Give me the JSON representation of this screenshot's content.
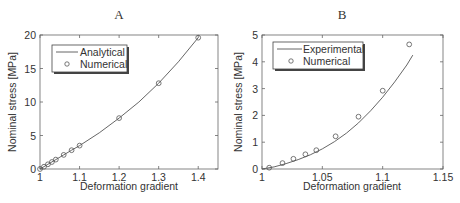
{
  "chart_data": [
    {
      "id": "A",
      "type": "line",
      "title": "A",
      "xlabel": "Deformation gradient",
      "ylabel": "Nominal stress [MPa]",
      "xlim": [
        1.0,
        1.45
      ],
      "ylim": [
        0,
        20
      ],
      "xticks": [
        1,
        1.1,
        1.2,
        1.3,
        1.4
      ],
      "xtick_labels": [
        "1",
        "1.1",
        "1.2",
        "1.3",
        "1.4"
      ],
      "yticks": [
        0,
        5,
        10,
        15,
        20
      ],
      "ytick_labels": [
        "0",
        "5",
        "10",
        "15",
        "20"
      ],
      "grid": false,
      "legend_position": "upper left",
      "series": [
        {
          "name": "Analytical",
          "style": "line",
          "x": [
            1.0,
            1.02,
            1.04,
            1.06,
            1.08,
            1.1,
            1.15,
            1.2,
            1.25,
            1.3,
            1.35,
            1.4
          ],
          "y": [
            0,
            0.7,
            1.4,
            2.1,
            2.8,
            3.5,
            5.4,
            7.6,
            10.0,
            12.8,
            16.0,
            19.6
          ]
        },
        {
          "name": "Numerical",
          "style": "marker-circle",
          "x": [
            1.0,
            1.01,
            1.02,
            1.03,
            1.04,
            1.06,
            1.08,
            1.1,
            1.2,
            1.3,
            1.4
          ],
          "y": [
            0,
            0.35,
            0.7,
            1.05,
            1.4,
            2.1,
            2.8,
            3.5,
            7.6,
            12.8,
            19.6
          ]
        }
      ]
    },
    {
      "id": "B",
      "type": "line",
      "title": "B",
      "xlabel": "Deformation gradient",
      "ylabel": "Nominal stress [MPa]",
      "xlim": [
        1.0,
        1.15
      ],
      "ylim": [
        0,
        5
      ],
      "xticks": [
        1,
        1.05,
        1.1,
        1.15
      ],
      "xtick_labels": [
        "1",
        "1.05",
        "1.1",
        "1.15"
      ],
      "yticks": [
        0,
        1,
        2,
        3,
        4,
        5
      ],
      "ytick_labels": [
        "0",
        "1",
        "2",
        "3",
        "4",
        "5"
      ],
      "grid": false,
      "legend_position": "upper left",
      "series": [
        {
          "name": "Experimental",
          "style": "line",
          "x": [
            1.0,
            1.01,
            1.02,
            1.03,
            1.04,
            1.05,
            1.06,
            1.07,
            1.08,
            1.09,
            1.1,
            1.11,
            1.12,
            1.125
          ],
          "y": [
            0,
            0.08,
            0.2,
            0.35,
            0.53,
            0.75,
            1.02,
            1.34,
            1.72,
            2.17,
            2.68,
            3.25,
            3.88,
            4.25
          ]
        },
        {
          "name": "Numerical",
          "style": "marker-circle",
          "x": [
            1.006,
            1.017,
            1.026,
            1.036,
            1.045,
            1.061,
            1.08,
            1.1,
            1.122
          ],
          "y": [
            0.05,
            0.22,
            0.38,
            0.55,
            0.7,
            1.22,
            1.95,
            2.92,
            4.65
          ]
        }
      ]
    }
  ],
  "colors": {
    "line": "#555555",
    "marker": "#555555",
    "axis": "#666666",
    "text": "#333333",
    "background": "#ffffff"
  }
}
